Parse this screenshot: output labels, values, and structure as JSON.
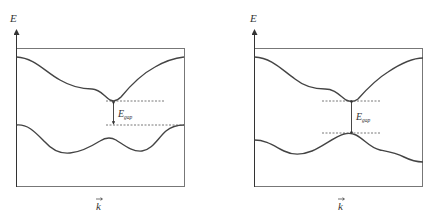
{
  "figure": {
    "panels": [
      {
        "id": "indirect",
        "y_axis_label": "E",
        "x_axis_label": "k",
        "x_axis_vector_arrow": true,
        "gap_label_main": "E",
        "gap_label_sub": "gap",
        "gap_type": "indirect"
      },
      {
        "id": "direct",
        "y_axis_label": "E",
        "x_axis_label": "k",
        "x_axis_vector_arrow": true,
        "gap_label_main": "E",
        "gap_label_sub": "gap",
        "gap_type": "direct"
      }
    ],
    "colors": {
      "line": "#444444",
      "frame": "#666666",
      "dashed": "#555555",
      "background": "#ffffff"
    }
  }
}
